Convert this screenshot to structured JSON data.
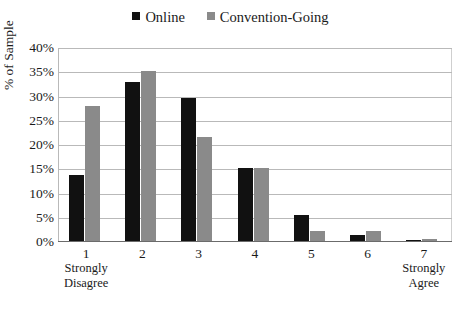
{
  "chart_data": {
    "type": "bar",
    "title": "",
    "subtitle": "",
    "xlabel": "",
    "ylabel": "% of Sample",
    "ylim": [
      0,
      40
    ],
    "ytick_labels": [
      "40%",
      "35%",
      "30%",
      "25%",
      "20%",
      "15%",
      "10%",
      "5%",
      "0%"
    ],
    "ytick_values": [
      40,
      35,
      30,
      25,
      20,
      15,
      10,
      5,
      0
    ],
    "grid": true,
    "legend_position": "top-center",
    "categories": [
      "1",
      "2",
      "3",
      "4",
      "5",
      "6",
      "7"
    ],
    "category_sublabels": [
      "Strongly Disagree",
      "",
      "",
      "",
      "",
      "",
      "Strongly Agree"
    ],
    "series": [
      {
        "name": "Online",
        "color": "#111111",
        "values": [
          13.6,
          32.8,
          29.4,
          15.0,
          5.4,
          1.3,
          0.2
        ]
      },
      {
        "name": "Convention-Going",
        "color": "#8a8a8a",
        "values": [
          27.9,
          35.0,
          21.5,
          15.0,
          2.1,
          2.0,
          0.4
        ]
      }
    ],
    "annotations": []
  },
  "legend": {
    "entries": [
      {
        "label": "Online",
        "swatch": "black-square-marker"
      },
      {
        "label": "Convention-Going",
        "swatch": "gray-square-marker"
      }
    ]
  },
  "colors": {
    "online": "#111111",
    "convention_going": "#8a8a8a",
    "gridline": "#b9b9b9",
    "axis": "#6b6b6b",
    "background": "#ffffff",
    "text": "#1a1a1a"
  }
}
